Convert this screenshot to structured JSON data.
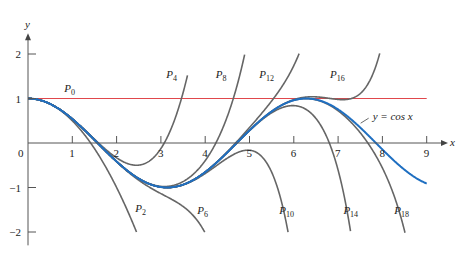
{
  "chart_data": {
    "type": "line",
    "title": "",
    "xlabel": "x",
    "ylabel": "y",
    "xlim": [
      0,
      9.3
    ],
    "ylim": [
      -2.3,
      2.4
    ],
    "grid": false,
    "x_ticks": [
      1,
      2,
      3,
      4,
      5,
      6,
      7,
      8,
      9
    ],
    "x_tick_labels": [
      "0",
      "1",
      "2",
      "3",
      "4",
      "5",
      "6",
      "7",
      "8",
      "9"
    ],
    "y_ticks": [
      2,
      1,
      -1,
      -2
    ],
    "y_tick_labels": [
      "2",
      "1",
      "-1",
      "-2"
    ],
    "series": [
      {
        "name": "y = cos x",
        "kind": "cos",
        "color": "#1f6fc1",
        "x_range": [
          0,
          9
        ]
      },
      {
        "name": "P0",
        "kind": "taylor",
        "degree": 0,
        "color": "#e0474c",
        "x_range": [
          0,
          9
        ]
      },
      {
        "name": "P2",
        "kind": "taylor",
        "degree": 2,
        "color": "#666666",
        "x_range": [
          0,
          2.5
        ]
      },
      {
        "name": "P4",
        "kind": "taylor",
        "degree": 4,
        "color": "#666666",
        "x_range": [
          0,
          3.6
        ]
      },
      {
        "name": "P6",
        "kind": "taylor",
        "degree": 6,
        "color": "#666666",
        "x_range": [
          0,
          4.1
        ]
      },
      {
        "name": "P8",
        "kind": "taylor",
        "degree": 8,
        "color": "#666666",
        "x_range": [
          0,
          5.2
        ]
      },
      {
        "name": "P10",
        "kind": "taylor",
        "degree": 10,
        "color": "#666666",
        "x_range": [
          0,
          5.9
        ]
      },
      {
        "name": "P12",
        "kind": "taylor",
        "degree": 12,
        "color": "#666666",
        "x_range": [
          0,
          6.9
        ]
      },
      {
        "name": "P14",
        "kind": "taylor",
        "degree": 14,
        "color": "#666666",
        "x_range": [
          0,
          7.4
        ]
      },
      {
        "name": "P16",
        "kind": "taylor",
        "degree": 16,
        "color": "#666666",
        "x_range": [
          0,
          8.2
        ]
      },
      {
        "name": "P18",
        "kind": "taylor",
        "degree": 18,
        "color": "#666666",
        "x_range": [
          0,
          8.6
        ]
      }
    ],
    "labels": [
      {
        "name": "P0",
        "base": "P",
        "sub": "0",
        "x": 1.0,
        "y": 1.15
      },
      {
        "name": "P2",
        "base": "P",
        "sub": "2",
        "x": 2.6,
        "y": -1.55
      },
      {
        "name": "P4",
        "base": "P",
        "sub": "4",
        "x": 3.3,
        "y": 1.45
      },
      {
        "name": "P6",
        "base": "P",
        "sub": "6",
        "x": 4.0,
        "y": -1.6
      },
      {
        "name": "P8",
        "base": "P",
        "sub": "8",
        "x": 4.42,
        "y": 1.45
      },
      {
        "name": "P10",
        "base": "P",
        "sub": "10",
        "x": 5.85,
        "y": -1.6
      },
      {
        "name": "P12",
        "base": "P",
        "sub": "12",
        "x": 5.4,
        "y": 1.45
      },
      {
        "name": "P14",
        "base": "P",
        "sub": "14",
        "x": 7.3,
        "y": -1.6
      },
      {
        "name": "P16",
        "base": "P",
        "sub": "16",
        "x": 7.0,
        "y": 1.45
      },
      {
        "name": "P18",
        "base": "P",
        "sub": "18",
        "x": 8.45,
        "y": -1.6
      }
    ],
    "annotations": [
      {
        "text": "y = cos x",
        "x": 7.78,
        "y": 0.58
      }
    ]
  },
  "axes": {
    "x_label": "x",
    "y_label": "y",
    "origin_label": "0"
  },
  "layout": {
    "origin_px": [
      28,
      143
    ],
    "px_per_unit_x": 44.3,
    "px_per_unit_y": 44.5
  }
}
